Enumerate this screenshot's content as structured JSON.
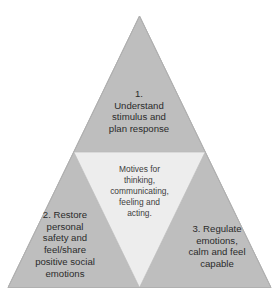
{
  "diagram": {
    "type": "subdivided-triangle",
    "colors": {
      "background": "#ffffff",
      "outer_fill": "#bebebe",
      "center_fill": "#ededed",
      "edge_stroke": "#a8a8a8",
      "text": "#2b2b2b"
    },
    "regions": {
      "top": {
        "name": "understand-stimulus",
        "number": "1.",
        "text": "1.\nUnderstand\nstimulus and\nplan response"
      },
      "center": {
        "name": "motives",
        "text": "Motives for\nthinking,\ncommunicating,\nfeeling and\nacting."
      },
      "bottom_left": {
        "name": "restore-personal-safety",
        "number": "2.",
        "text": "2. Restore\npersonal\nsafety and\nfeel/share\npositive social\nemotions"
      },
      "bottom_right": {
        "name": "regulate-emotions",
        "number": "3.",
        "text": "3. Regulate\nemotions,\ncalm and feel\ncapable"
      }
    }
  }
}
